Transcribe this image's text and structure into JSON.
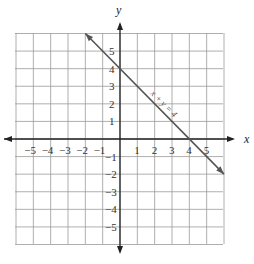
{
  "chart_data": {
    "type": "line",
    "title": "",
    "xlabel": "x",
    "ylabel": "y",
    "xlim": [
      -6,
      6
    ],
    "ylim": [
      -6,
      6
    ],
    "grid": true,
    "x_ticks": [
      "-5",
      "-4",
      "-3",
      "-2",
      "-1",
      "1",
      "2",
      "3",
      "4",
      "5"
    ],
    "y_ticks": [
      "5",
      "4",
      "3",
      "2",
      "1",
      "-1",
      "-2",
      "-3",
      "-4",
      "-5"
    ],
    "series": [
      {
        "name": "x + y = 4",
        "x": [
          -2,
          6
        ],
        "y": [
          6,
          -2
        ],
        "color": "#555555"
      }
    ],
    "annotations": [
      {
        "text": "x + y = 4",
        "x": 2.8,
        "y": 2.2
      }
    ]
  },
  "labels": {
    "x_axis": "x",
    "y_axis": "y",
    "equation": "x + y = 4"
  }
}
